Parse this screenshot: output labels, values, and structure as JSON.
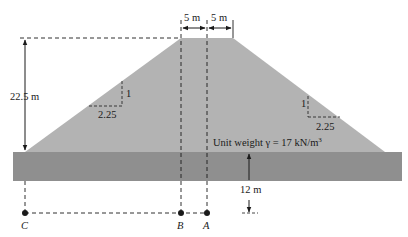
{
  "diagram": {
    "type": "embankment-cross-section",
    "labels": {
      "height": "22.5 m",
      "crest_left": "5 m",
      "crest_right": "5 m",
      "slope_left_vertical": "1",
      "slope_left_horizontal": "2.25",
      "slope_right_vertical": "1",
      "slope_right_horizontal": "2.25",
      "unit_weight_prefix": "Unit weight γ = 17 kN/m",
      "unit_weight_exp": "3",
      "depth": "12 m",
      "point_c": "C",
      "point_b": "B",
      "point_a": "A"
    },
    "colors": {
      "embankment": "#b3b3b3",
      "soil_layer": "#8f8f8f",
      "line": "#1a1a1a"
    }
  }
}
